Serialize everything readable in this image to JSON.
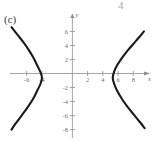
{
  "figure": {
    "part_label": "(c)",
    "page_remnant_left": "",
    "page_remnant_right": "4"
  },
  "chart_data": {
    "type": "line",
    "title": "",
    "subtitle": "",
    "xlabel": "x",
    "ylabel": "y",
    "xlim": [
      -8.2,
      10.2
    ],
    "ylim": [
      -9.2,
      8.2
    ],
    "grid": false,
    "legend": null,
    "x_ticks": [
      -6,
      -4,
      2,
      4,
      6,
      8
    ],
    "x_tick_labels": [
      "-6",
      "-4",
      "2",
      "4",
      "6",
      "8"
    ],
    "y_ticks": [
      6,
      4,
      2,
      -2,
      -4,
      -6,
      -8
    ],
    "y_tick_labels": [
      "6",
      "4",
      "2",
      "-2",
      "-4",
      "-6",
      "-8"
    ],
    "center": [
      0.6,
      -0.6
    ],
    "vertices": [
      [
        -4.0,
        -0.6
      ],
      [
        5.3,
        -0.6
      ]
    ],
    "series": [
      {
        "name": "left-branch",
        "points": [
          [
            -8.0,
            6.6
          ],
          [
            -7.2,
            5.5
          ],
          [
            -6.4,
            4.4
          ],
          [
            -5.7,
            3.3
          ],
          [
            -5.1,
            2.2
          ],
          [
            -4.6,
            1.1
          ],
          [
            -4.2,
            0.2
          ],
          [
            -4.0,
            -0.6
          ],
          [
            -4.2,
            -1.5
          ],
          [
            -4.6,
            -2.4
          ],
          [
            -5.1,
            -3.5
          ],
          [
            -5.8,
            -4.7
          ],
          [
            -6.6,
            -5.9
          ],
          [
            -7.5,
            -7.2
          ],
          [
            -8.0,
            -8.0
          ]
        ]
      },
      {
        "name": "right-branch",
        "points": [
          [
            9.4,
            6.0
          ],
          [
            8.8,
            5.2
          ],
          [
            8.0,
            4.2
          ],
          [
            7.2,
            3.2
          ],
          [
            6.5,
            2.2
          ],
          [
            5.9,
            1.2
          ],
          [
            5.5,
            0.3
          ],
          [
            5.3,
            -0.6
          ],
          [
            5.5,
            -1.5
          ],
          [
            5.9,
            -2.5
          ],
          [
            6.5,
            -3.6
          ],
          [
            7.2,
            -4.7
          ],
          [
            8.1,
            -5.9
          ],
          [
            9.0,
            -7.1
          ],
          [
            9.5,
            -7.8
          ]
        ]
      }
    ]
  }
}
